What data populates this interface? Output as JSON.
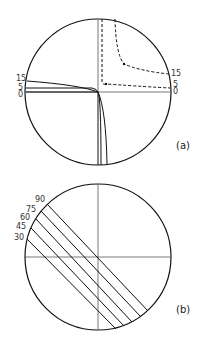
{
  "figure": {
    "panels": [
      {
        "id": "a",
        "caption": "(a)",
        "solid_labels": [
          "15",
          "5",
          "0"
        ],
        "dashed_labels": [
          "15",
          "5",
          "0"
        ]
      },
      {
        "id": "b",
        "caption": "(b)",
        "line_labels": [
          "90",
          "75",
          "60",
          "45",
          "30"
        ]
      }
    ],
    "colors": {
      "stroke": "#111111",
      "axis": "#555555",
      "background": "#ffffff"
    }
  }
}
